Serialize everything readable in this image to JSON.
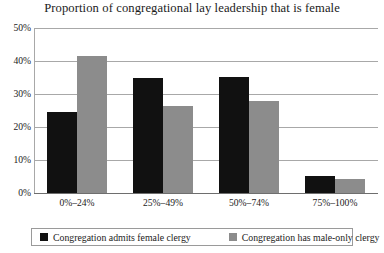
{
  "chart_data": {
    "type": "bar",
    "title": "Proportion of congregational lay leadership that is female",
    "xlabel": "",
    "ylabel": "",
    "categories": [
      "0%–24%",
      "25%–49%",
      "50%–74%",
      "75%–100%"
    ],
    "series": [
      {
        "name": "Congregation admits female clergy",
        "color": "#111111",
        "values": [
          24.5,
          34.8,
          35.2,
          5.3
        ]
      },
      {
        "name": "Congregation has male-only clergy",
        "color": "#8c8c8c",
        "values": [
          41.5,
          26.5,
          27.9,
          4.3
        ]
      }
    ],
    "ylim": [
      0,
      50
    ],
    "yticks": [
      0,
      10,
      20,
      30,
      40,
      50
    ],
    "ytick_labels": [
      "0%",
      "10%",
      "20%",
      "30%",
      "40%",
      "50%"
    ],
    "grid": "horizontal",
    "legend_position": "bottom"
  },
  "legend": {
    "entries": [
      {
        "label": "Congregation admits female clergy",
        "color": "#111111"
      },
      {
        "label": "Congregation has male-only clergy",
        "color": "#8c8c8c"
      }
    ]
  }
}
